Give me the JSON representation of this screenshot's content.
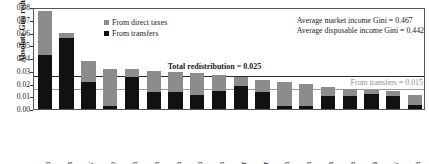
{
  "chart_data": {
    "type": "bar",
    "title": "",
    "subtitle": "",
    "xlabel": "",
    "ylabel": "Absolute Gini reduction",
    "ylim": [
      0.0,
      0.08
    ],
    "yticks": [
      "0.00",
      "0.01",
      "0.02",
      "0.03",
      "0.04",
      "0.05",
      "0.06",
      "0.07",
      "0.08"
    ],
    "grid": false,
    "stacked": true,
    "legend_position": "upper-center-left",
    "categories": [
      "South africa",
      "Iran",
      "Uruguay",
      "Mexico",
      "Russia",
      "Armenia",
      "Tanzania",
      "Albania",
      "Panama",
      "El Salvador",
      "Ecuador",
      "Ghana",
      "Uganda",
      "Jordan",
      "Colombia",
      "Peru",
      "Paraguay",
      "Indonesia"
    ],
    "series": [
      {
        "name": "From transfers",
        "color": "#111111",
        "values": [
          0.042,
          0.056,
          0.021,
          0.002,
          0.025,
          0.013,
          0.013,
          0.011,
          0.014,
          0.018,
          0.013,
          0.002,
          0.002,
          0.01,
          0.01,
          0.012,
          0.01,
          0.003
        ]
      },
      {
        "name": "From direct taxes",
        "color": "#8c8c8c",
        "values": [
          0.035,
          0.004,
          0.017,
          0.029,
          0.006,
          0.017,
          0.016,
          0.017,
          0.013,
          0.007,
          0.01,
          0.019,
          0.018,
          0.007,
          0.006,
          0.003,
          0.004,
          0.008
        ]
      }
    ],
    "totals": [
      0.077,
      0.06,
      0.038,
      0.031,
      0.031,
      0.03,
      0.029,
      0.028,
      0.027,
      0.025,
      0.023,
      0.021,
      0.02,
      0.017,
      0.016,
      0.015,
      0.014,
      0.011
    ],
    "reference_lines": [
      {
        "name": "total-redistribution",
        "value": 0.025,
        "label": "Total redistribution = 0.025",
        "color": "#2b2b2b"
      },
      {
        "name": "from-transfers",
        "value": 0.015,
        "label": "From transfers = 0.015",
        "color": "#9a9a9a"
      }
    ],
    "annotations": [
      "Average market income Gini = 0.467",
      "Average disposable income Gini = 0.442"
    ]
  },
  "legend": {
    "taxes_label": "From direct taxes",
    "transfers_label": "From transfers"
  },
  "annotations": {
    "gini_market": "Average market income Gini = 0.467",
    "gini_disposable": "Average disposable income Gini = 0.442",
    "total_redistribution": "Total redistribution = 0.025",
    "from_transfers": "From transfers = 0.015"
  },
  "axis": {
    "y_title": "Absolute Gini reduction"
  }
}
